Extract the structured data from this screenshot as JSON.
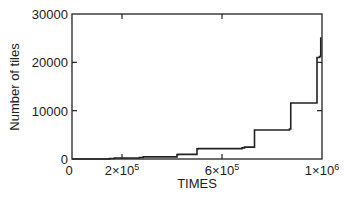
{
  "chart_data": {
    "type": "line",
    "subtype": "step",
    "title": "",
    "xlabel": "TIMES",
    "ylabel": "Number of tiles",
    "xlim": [
      0,
      1000000
    ],
    "ylim": [
      0,
      30000
    ],
    "x_ticks": [
      0,
      200000,
      600000,
      1000000
    ],
    "x_tick_labels": [
      {
        "base": "0",
        "exp": ""
      },
      {
        "base": "2×10",
        "exp": "5"
      },
      {
        "base": "6×10",
        "exp": "5"
      },
      {
        "base": "1×10",
        "exp": "6"
      }
    ],
    "y_ticks": [
      0,
      10000,
      20000,
      30000
    ],
    "y_tick_labels": [
      "0",
      "10000",
      "20000",
      "30000"
    ],
    "grid": false,
    "legend": null,
    "series": [
      {
        "name": "Number of tiles",
        "color": "#222222",
        "x": [
          0,
          150000,
          170000,
          270000,
          285000,
          420000,
          425000,
          500000,
          505000,
          680000,
          690000,
          730000,
          735000,
          870000,
          875000,
          975000,
          980000,
          990000,
          995000
        ],
        "y": [
          0,
          100,
          200,
          300,
          450,
          900,
          950,
          2100,
          2150,
          2300,
          2450,
          6000,
          6000,
          6200,
          11600,
          11600,
          21000,
          21200,
          25200
        ]
      }
    ]
  }
}
